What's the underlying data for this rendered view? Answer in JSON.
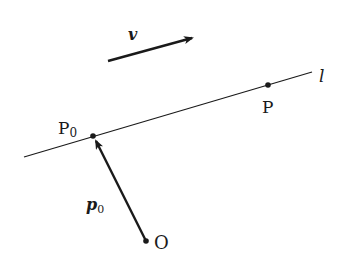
{
  "diagram": {
    "title": "",
    "colors": {
      "stroke": "#1a1a1a",
      "background": "#ffffff"
    },
    "labels": {
      "line": "l",
      "point_p0": "P",
      "point_p0_sub": "0",
      "point_p": "P",
      "origin": "O",
      "vector_v": "v",
      "vector_p0": "p",
      "vector_p0_sub": "0"
    },
    "elements": [
      {
        "id": "line-l",
        "type": "line",
        "from": [
          24,
          157
        ],
        "to": [
          312,
          72
        ],
        "label": "l"
      },
      {
        "id": "point-P0",
        "type": "point",
        "at": [
          93,
          136
        ],
        "label": "P0"
      },
      {
        "id": "point-P",
        "type": "point",
        "at": [
          268,
          85
        ],
        "label": "P"
      },
      {
        "id": "point-O",
        "type": "point",
        "at": [
          146,
          241
        ],
        "label": "O"
      },
      {
        "id": "vector-p0",
        "type": "arrow",
        "from": [
          146,
          241
        ],
        "to": [
          94,
          138
        ],
        "label": "p0"
      },
      {
        "id": "vector-v",
        "type": "arrow",
        "from": [
          108,
          61
        ],
        "to": [
          194,
          37
        ],
        "label": "v"
      }
    ]
  }
}
